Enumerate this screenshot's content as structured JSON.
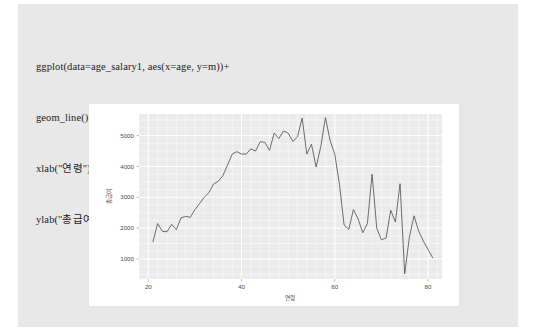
{
  "code": {
    "lines": [
      "ggplot(data=age_salary1, aes(x=age, y=m))+",
      "geom_line()+",
      "xlab(\"연령\")+",
      "ylab(\"총급여\")"
    ]
  },
  "chart_data": {
    "type": "line",
    "title": "",
    "xlabel": "연령",
    "ylabel": "총급여",
    "xlim": [
      18,
      83
    ],
    "ylim": [
      350,
      5700
    ],
    "xticks": [
      20,
      40,
      60,
      80
    ],
    "yticks": [
      1000,
      2000,
      3000,
      4000,
      5000
    ],
    "grid": true,
    "legend": "none",
    "panel_background": "#ebebeb",
    "grid_color": "#ffffff",
    "line_color": "#555555",
    "x": [
      21,
      22,
      23,
      24,
      25,
      26,
      27,
      28,
      29,
      30,
      31,
      32,
      33,
      34,
      35,
      36,
      37,
      38,
      39,
      40,
      41,
      42,
      43,
      44,
      45,
      46,
      47,
      48,
      49,
      50,
      51,
      52,
      53,
      54,
      55,
      56,
      57,
      58,
      59,
      60,
      61,
      62,
      63,
      64,
      65,
      66,
      67,
      68,
      69,
      70,
      71,
      72,
      73,
      74,
      75,
      76,
      77,
      78,
      79,
      80,
      81
    ],
    "y": [
      1560,
      2150,
      1900,
      1880,
      2120,
      1950,
      2330,
      2380,
      2350,
      2600,
      2800,
      3000,
      3150,
      3430,
      3520,
      3700,
      4050,
      4400,
      4480,
      4400,
      4400,
      4570,
      4500,
      4800,
      4780,
      4520,
      5080,
      4900,
      5150,
      5080,
      4810,
      4960,
      5570,
      4400,
      4720,
      3980,
      4650,
      5580,
      4840,
      4400,
      3420,
      2100,
      1960,
      2600,
      2300,
      1850,
      2150,
      3750,
      2000,
      1620,
      1680,
      2580,
      2200,
      3440,
      520,
      1700,
      2400,
      1900,
      1580,
      1310,
      1040
    ]
  }
}
